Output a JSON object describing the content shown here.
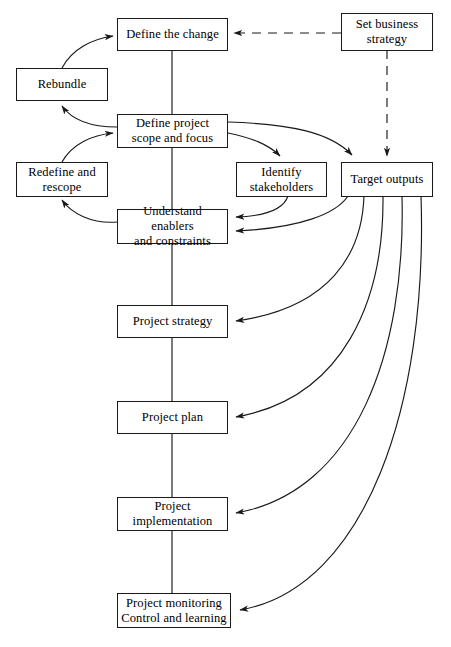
{
  "diagram": {
    "stroke_color": "#1a1a1a",
    "background_color": "#ffffff",
    "nodes": [
      {
        "id": "define-the-change",
        "label": "Define the change"
      },
      {
        "id": "set-business-strategy",
        "label": "Set business\nstrategy"
      },
      {
        "id": "rebundle",
        "label": "Rebundle"
      },
      {
        "id": "define-project-scope",
        "label": "Define project\nscope and focus"
      },
      {
        "id": "redefine-and-rescope",
        "label": "Redefine and\nrescope"
      },
      {
        "id": "identify-stakeholders",
        "label": "Identify\nstakeholders"
      },
      {
        "id": "target-outputs",
        "label": "Target outputs"
      },
      {
        "id": "understand-enablers",
        "label": "Understand enablers\nand constraints"
      },
      {
        "id": "project-strategy",
        "label": "Project strategy"
      },
      {
        "id": "project-plan",
        "label": "Project plan"
      },
      {
        "id": "project-implementation",
        "label": "Project\nimplementation"
      },
      {
        "id": "project-monitoring",
        "label": "Project monitoring\nControl and learning"
      }
    ],
    "edges": [
      {
        "from": "set-business-strategy",
        "to": "define-the-change",
        "style": "dashed",
        "arrow": true
      },
      {
        "from": "set-business-strategy",
        "to": "target-outputs",
        "style": "dashed",
        "arrow": true
      },
      {
        "from": "define-the-change",
        "to": "define-project-scope",
        "style": "solid",
        "arrow": false
      },
      {
        "from": "rebundle",
        "to": "define-the-change",
        "style": "solid",
        "arrow": true
      },
      {
        "from": "define-project-scope",
        "to": "rebundle",
        "style": "solid",
        "arrow": true
      },
      {
        "from": "define-project-scope",
        "to": "identify-stakeholders",
        "style": "solid",
        "arrow": true
      },
      {
        "from": "define-project-scope",
        "to": "target-outputs",
        "style": "solid",
        "arrow": true
      },
      {
        "from": "define-project-scope",
        "to": "understand-enablers",
        "style": "solid",
        "arrow": false
      },
      {
        "from": "redefine-and-rescope",
        "to": "define-project-scope",
        "style": "solid",
        "arrow": true
      },
      {
        "from": "understand-enablers",
        "to": "redefine-and-rescope",
        "style": "solid",
        "arrow": true
      },
      {
        "from": "identify-stakeholders",
        "to": "understand-enablers",
        "style": "solid",
        "arrow": true
      },
      {
        "from": "target-outputs",
        "to": "understand-enablers",
        "style": "solid",
        "arrow": true
      },
      {
        "from": "understand-enablers",
        "to": "project-strategy",
        "style": "solid",
        "arrow": false
      },
      {
        "from": "target-outputs",
        "to": "project-strategy",
        "style": "solid",
        "arrow": true
      },
      {
        "from": "project-strategy",
        "to": "project-plan",
        "style": "solid",
        "arrow": false
      },
      {
        "from": "target-outputs",
        "to": "project-plan",
        "style": "solid",
        "arrow": true
      },
      {
        "from": "project-plan",
        "to": "project-implementation",
        "style": "solid",
        "arrow": false
      },
      {
        "from": "target-outputs",
        "to": "project-implementation",
        "style": "solid",
        "arrow": true
      },
      {
        "from": "project-implementation",
        "to": "project-monitoring",
        "style": "solid",
        "arrow": false
      },
      {
        "from": "target-outputs",
        "to": "project-monitoring",
        "style": "solid",
        "arrow": true
      }
    ]
  }
}
